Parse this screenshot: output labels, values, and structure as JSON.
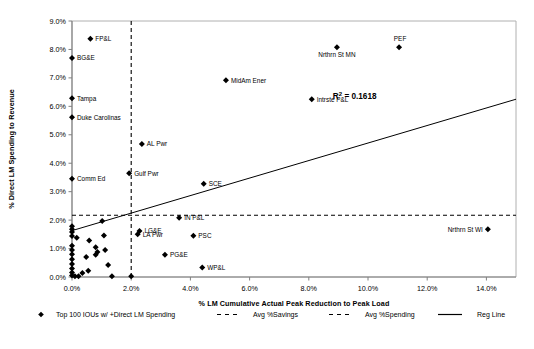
{
  "chart_data": {
    "type": "scatter",
    "title": "",
    "xlabel": "% LM Cumulative Actual Peak Reduction to Peak Load",
    "ylabel": "% Direct LM Spending to Revenue",
    "xlim": [
      0,
      15.0
    ],
    "ylim": [
      0,
      9.0
    ],
    "xticks": [
      "0.0%",
      "2.0%",
      "4.0%",
      "6.0%",
      "8.0%",
      "10.0%",
      "12.0%",
      "14.0%"
    ],
    "xtick_values": [
      0,
      2,
      4,
      6,
      8,
      10,
      12,
      14
    ],
    "yticks": [
      "0.0%",
      "1.0%",
      "2.0%",
      "3.0%",
      "4.0%",
      "5.0%",
      "6.0%",
      "7.0%",
      "8.0%",
      "9.0%"
    ],
    "ytick_values": [
      0,
      1,
      2,
      3,
      4,
      5,
      6,
      7,
      8,
      9
    ],
    "grid": false,
    "legend_position": "bottom",
    "annotations": [
      {
        "text": "R² = 0.1618",
        "x": 9.55,
        "y": 6.25
      }
    ],
    "reference_lines": [
      {
        "name": "Avg %Savings",
        "orientation": "vertical",
        "value": 2.0,
        "style": "dashed"
      },
      {
        "name": "Avg %Spending",
        "orientation": "horizontal",
        "value": 2.17,
        "style": "dashed"
      }
    ],
    "regression_line": {
      "name": "Reg Line",
      "x1": 0.0,
      "y1": 1.63,
      "x2": 15.0,
      "y2": 6.25,
      "r_squared": 0.1618
    },
    "series": [
      {
        "name": "Top 100 IOUs w/ +Direct LM Spending",
        "marker": "diamond",
        "color": "#000000",
        "points": [
          {
            "label": "FP&L",
            "x": 0.62,
            "y": 8.38,
            "label_pos": "right"
          },
          {
            "label": "BG&E",
            "x": 0.0,
            "y": 7.7,
            "label_pos": "right"
          },
          {
            "label": "Tampa",
            "x": 0.0,
            "y": 6.28,
            "label_pos": "right"
          },
          {
            "label": "Duke Carolinas",
            "x": 0.0,
            "y": 5.62,
            "label_pos": "right"
          },
          {
            "label": "PEF",
            "x": 11.05,
            "y": 8.08,
            "label_pos": "above-right"
          },
          {
            "label": "Nrthrn St MN",
            "x": 8.95,
            "y": 8.08,
            "label_pos": "below"
          },
          {
            "label": "MidAm Ener",
            "x": 5.2,
            "y": 6.92,
            "label_pos": "right"
          },
          {
            "label": "Intrste P&L",
            "x": 8.1,
            "y": 6.25,
            "label_pos": "right"
          },
          {
            "label": "AL Pwr",
            "x": 2.36,
            "y": 4.68,
            "label_pos": "right"
          },
          {
            "label": "Gulf Pwr",
            "x": 1.93,
            "y": 3.65,
            "label_pos": "right"
          },
          {
            "label": "Comm Ed",
            "x": 0.0,
            "y": 3.45,
            "label_pos": "right"
          },
          {
            "label": "SCE",
            "x": 4.45,
            "y": 3.28,
            "label_pos": "right"
          },
          {
            "label": "IN P&L",
            "x": 3.62,
            "y": 2.08,
            "label_pos": "right"
          },
          {
            "label": "LG&E",
            "x": 2.28,
            "y": 1.62,
            "label_pos": "right"
          },
          {
            "label": "LA Pwr",
            "x": 2.22,
            "y": 1.5,
            "label_pos": "right"
          },
          {
            "label": "PSC",
            "x": 4.1,
            "y": 1.45,
            "label_pos": "right"
          },
          {
            "label": "PG&E",
            "x": 3.14,
            "y": 0.78,
            "label_pos": "right"
          },
          {
            "label": "WP&L",
            "x": 4.4,
            "y": 0.33,
            "label_pos": "right"
          },
          {
            "label": "Nrthrn St WI",
            "x": 14.05,
            "y": 1.68,
            "label_pos": "left"
          },
          {
            "label": "",
            "x": 0.0,
            "y": 1.78
          },
          {
            "label": "",
            "x": 0.0,
            "y": 1.68
          },
          {
            "label": "",
            "x": 0.0,
            "y": 1.58
          },
          {
            "label": "",
            "x": 0.0,
            "y": 1.44
          },
          {
            "label": "",
            "x": 0.0,
            "y": 1.1
          },
          {
            "label": "",
            "x": 0.0,
            "y": 0.95
          },
          {
            "label": "",
            "x": 0.0,
            "y": 0.8
          },
          {
            "label": "",
            "x": 0.0,
            "y": 0.62
          },
          {
            "label": "",
            "x": 0.0,
            "y": 0.46
          },
          {
            "label": "",
            "x": 0.0,
            "y": 0.3
          },
          {
            "label": "",
            "x": 0.0,
            "y": 0.16
          },
          {
            "label": "",
            "x": 0.0,
            "y": 0.05
          },
          {
            "label": "",
            "x": 0.1,
            "y": 0.03
          },
          {
            "label": "",
            "x": 0.22,
            "y": 0.03
          },
          {
            "label": "",
            "x": 0.16,
            "y": 1.38
          },
          {
            "label": "",
            "x": 0.58,
            "y": 1.28
          },
          {
            "label": "",
            "x": 0.48,
            "y": 0.7
          },
          {
            "label": "",
            "x": 0.8,
            "y": 1.05
          },
          {
            "label": "",
            "x": 0.86,
            "y": 0.88
          },
          {
            "label": "",
            "x": 0.8,
            "y": 0.78
          },
          {
            "label": "",
            "x": 1.02,
            "y": 1.97
          },
          {
            "label": "",
            "x": 1.08,
            "y": 1.46
          },
          {
            "label": "",
            "x": 1.12,
            "y": 0.95
          },
          {
            "label": "",
            "x": 1.22,
            "y": 0.42
          },
          {
            "label": "",
            "x": 1.35,
            "y": 0.03
          },
          {
            "label": "",
            "x": 2.0,
            "y": 0.03
          },
          {
            "label": "",
            "x": 0.35,
            "y": 0.14
          },
          {
            "label": "",
            "x": 0.55,
            "y": 0.22
          }
        ]
      }
    ],
    "legend": [
      {
        "label": "Top 100 IOUs w/ +Direct LM Spending",
        "marker": "diamond"
      },
      {
        "label": "Avg %Savings",
        "marker": "dashed-line"
      },
      {
        "label": "Avg %Spending",
        "marker": "dashed-line"
      },
      {
        "label": "Reg Line",
        "marker": "solid-line"
      }
    ]
  },
  "colors": {
    "marker": "#000000",
    "axis": "#808080",
    "plot_border": "#b0b0b0",
    "text": "#000000",
    "reg_line": "#000000"
  }
}
